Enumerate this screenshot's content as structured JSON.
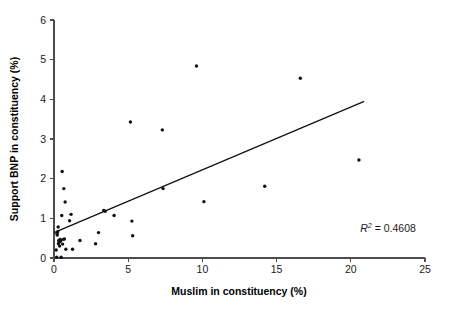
{
  "chart_data": {
    "type": "scatter",
    "title": "",
    "xlabel": "Muslim in constituency (%)",
    "ylabel": "Support BNP in constituency (%)",
    "xlim": [
      0,
      25
    ],
    "ylim": [
      0,
      6
    ],
    "xticks": [
      0,
      5,
      10,
      15,
      20,
      25
    ],
    "yticks": [
      0,
      1,
      2,
      3,
      4,
      5,
      6
    ],
    "xtick_labels": [
      "0",
      "5",
      "10",
      "15",
      "20",
      "25"
    ],
    "ytick_labels": [
      "0",
      "1",
      "2",
      "3",
      "4",
      "5",
      "6"
    ],
    "grid": false,
    "legend": null,
    "annotations": [
      {
        "name": "r-squared",
        "prefix": "R",
        "superscript": "2",
        "suffix": " = 0.4608",
        "text": "R2 = 0.4608",
        "x": 20.6,
        "y": 0.62
      }
    ],
    "series": [
      {
        "name": "constituencies",
        "marker": "dot",
        "color": "#111111",
        "points": [
          [
            0.15,
            0.2
          ],
          [
            0.18,
            0.02
          ],
          [
            0.2,
            0.62
          ],
          [
            0.22,
            0.58
          ],
          [
            0.25,
            0.66
          ],
          [
            0.28,
            0.78
          ],
          [
            0.3,
            0.36
          ],
          [
            0.32,
            0.44
          ],
          [
            0.35,
            0.4
          ],
          [
            0.38,
            0.3
          ],
          [
            0.42,
            0.47
          ],
          [
            0.45,
            0.43
          ],
          [
            0.48,
            0.02
          ],
          [
            0.52,
            1.07
          ],
          [
            0.55,
            2.18
          ],
          [
            0.58,
            0.35
          ],
          [
            0.62,
            0.47
          ],
          [
            0.66,
            1.75
          ],
          [
            0.7,
            0.48
          ],
          [
            0.75,
            1.41
          ],
          [
            0.8,
            0.22
          ],
          [
            1.05,
            0.94
          ],
          [
            1.15,
            1.1
          ],
          [
            1.25,
            0.22
          ],
          [
            1.75,
            0.44
          ],
          [
            2.8,
            0.36
          ],
          [
            3.0,
            0.64
          ],
          [
            3.35,
            1.2
          ],
          [
            3.45,
            1.18
          ],
          [
            4.05,
            1.07
          ],
          [
            5.15,
            3.43
          ],
          [
            5.25,
            0.93
          ],
          [
            5.3,
            0.56
          ],
          [
            7.3,
            3.23
          ],
          [
            7.35,
            1.75
          ],
          [
            9.6,
            4.84
          ],
          [
            10.1,
            1.42
          ],
          [
            14.2,
            1.81
          ],
          [
            16.6,
            4.53
          ],
          [
            20.55,
            2.47
          ]
        ]
      }
    ],
    "trendline": {
      "name": "linear-fit",
      "x0": 0.0,
      "y0": 0.64,
      "x1": 20.9,
      "y1": 3.95,
      "color": "#111111"
    }
  }
}
